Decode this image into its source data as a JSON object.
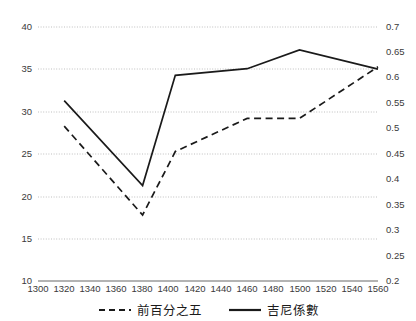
{
  "chart_data": {
    "type": "line",
    "title": "",
    "xlabel": "",
    "ylabel": "",
    "y_left_label": "",
    "y_right_label": "",
    "xlim": [
      1300,
      1560
    ],
    "ylim_left": [
      10,
      40
    ],
    "ylim_right": [
      0.2,
      0.7
    ],
    "grid": true,
    "legend_position": "bottom",
    "x_ticks": [
      1300,
      1320,
      1340,
      1360,
      1380,
      1400,
      1420,
      1440,
      1460,
      1480,
      1500,
      1520,
      1540,
      1560
    ],
    "y_left_ticks": [
      10,
      15,
      20,
      25,
      30,
      35,
      40
    ],
    "y_right_ticks": [
      0.2,
      0.25,
      0.3,
      0.35,
      0.4,
      0.45,
      0.5,
      0.55,
      0.6,
      0.65,
      0.7
    ],
    "series": [
      {
        "name": "前百分之五",
        "style": "dashed",
        "axis": "left",
        "color": "#1a1a1a",
        "x": [
          1320,
          1380,
          1405,
          1460,
          1500,
          1560
        ],
        "values": [
          28.3,
          17.8,
          25.3,
          29.2,
          29.2,
          35.3
        ]
      },
      {
        "name": "吉尼係數",
        "style": "solid",
        "axis": "right",
        "color": "#1a1a1a",
        "x": [
          1320,
          1380,
          1405,
          1460,
          1500,
          1560
        ],
        "values": [
          0.555,
          0.388,
          0.605,
          0.618,
          0.655,
          0.617
        ]
      }
    ]
  },
  "axes": {
    "x_ticks": [
      "1300",
      "1320",
      "1340",
      "1360",
      "1380",
      "1400",
      "1420",
      "1440",
      "1460",
      "1480",
      "1500",
      "1520",
      "1540",
      "1560"
    ],
    "y_left_ticks": [
      "40",
      "35",
      "30",
      "25",
      "20",
      "15",
      "10"
    ],
    "y_right_ticks": [
      "0.7",
      "0.65",
      "0.6",
      "0.55",
      "0.5",
      "0.45",
      "0.4",
      "0.35",
      "0.3",
      "0.25",
      "0.2"
    ]
  },
  "legend": {
    "items": [
      {
        "label": "前百分之五",
        "style": "dashed"
      },
      {
        "label": "吉尼係數",
        "style": "solid"
      }
    ]
  },
  "colors": {
    "line": "#1a1a1a",
    "grid": "#bfbfbf",
    "axis": "#9a9a9a",
    "text": "#3a3a3a"
  }
}
